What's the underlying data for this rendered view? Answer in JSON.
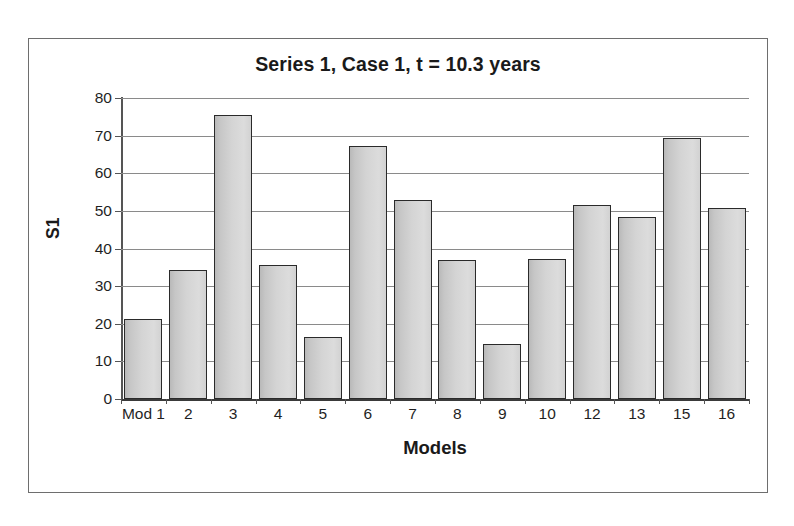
{
  "chart_data": {
    "type": "bar",
    "title": "Series 1, Case 1, t = 10.3 years",
    "xlabel": "Models",
    "ylabel": "S1",
    "categories": [
      "Mod 1",
      "2",
      "3",
      "4",
      "5",
      "6",
      "7",
      "8",
      "9",
      "10",
      "12",
      "13",
      "15",
      "16"
    ],
    "values": [
      21.3,
      34.4,
      75.4,
      35.5,
      16.6,
      67.3,
      52.9,
      36.9,
      14.6,
      37.2,
      51.6,
      48.4,
      69.5,
      50.7
    ],
    "ylim": [
      0,
      80
    ],
    "ytick_values": [
      0,
      10,
      20,
      30,
      40,
      50,
      60,
      70,
      80
    ],
    "ytick_labels": [
      "0",
      "10",
      "20",
      "30",
      "40",
      "50",
      "60",
      "70",
      "80"
    ],
    "grid": true,
    "legend": false,
    "bar_fill_color": "#d4d4d4",
    "bar_border_color": "#2a2a2a",
    "gridline_color": "#8a8a8a",
    "frame_border_color": "#6e6e6e",
    "background_color": "#ffffff"
  }
}
